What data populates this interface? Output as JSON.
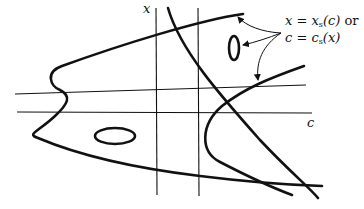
{
  "diagram": {
    "type": "bifurcation-curve-sketch",
    "axes": {
      "vertical_label": "x",
      "horizontal_label": "c"
    },
    "annotation": {
      "line1": "x = x_s(c) or",
      "line2": "c = c_s(x)",
      "line1_parts": {
        "lhs": "x",
        "eq": " = ",
        "fn": "x",
        "sub": "s",
        "arg": "(c)",
        "tail": " or"
      },
      "line2_parts": {
        "lhs": "c",
        "eq": " = ",
        "fn": "c",
        "sub": "s",
        "arg": "(x)"
      }
    },
    "elements": [
      "two vertical lines",
      "two nearly horizontal lines",
      "S-shaped curve on left",
      "intersecting curves on right",
      "small vertical ellipse (upper right)",
      "horizontal ellipse (lower left)",
      "three arrows pointing from annotation to curves"
    ],
    "colors": {
      "stroke": "#111111",
      "background": "#ffffff"
    }
  }
}
